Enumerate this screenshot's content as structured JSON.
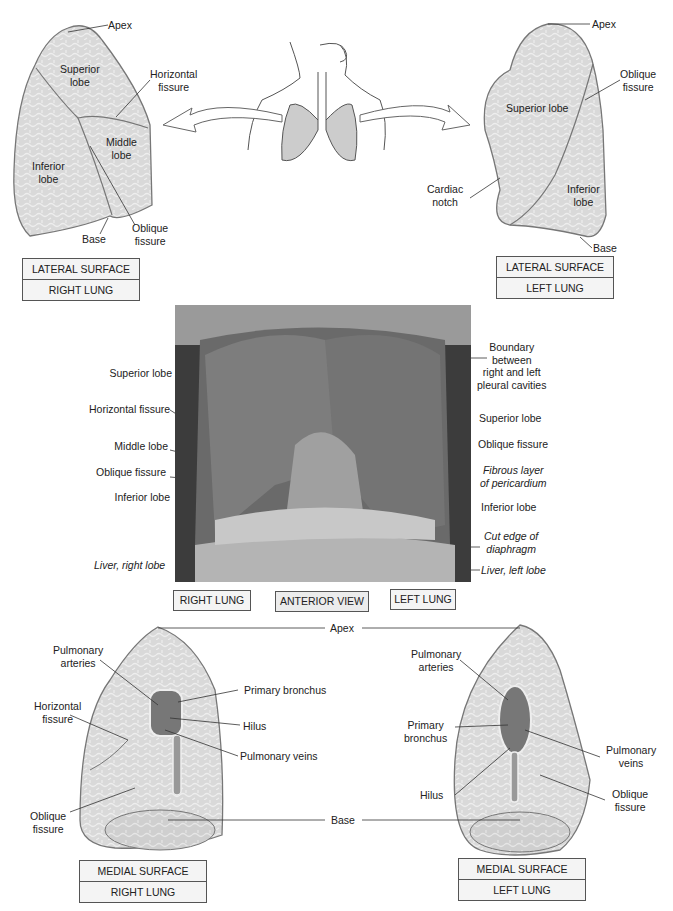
{
  "top_left": {
    "labels": {
      "apex": "Apex",
      "superior_lobe": "Superior\nlobe",
      "horizontal_fissure": "Horizontal\nfissure",
      "middle_lobe": "Middle\nlobe",
      "inferior_lobe": "Inferior\nlobe",
      "base": "Base",
      "oblique_fissure": "Oblique\nfissure"
    },
    "caption": {
      "line1": "LATERAL SURFACE",
      "line2": "RIGHT LUNG"
    }
  },
  "top_right": {
    "labels": {
      "apex": "Apex",
      "oblique_fissure": "Oblique\nfissure",
      "superior_lobe": "Superior lobe",
      "cardiac_notch": "Cardiac\nnotch",
      "inferior_lobe": "Inferior\nlobe",
      "base": "Base"
    },
    "caption": {
      "line1": "LATERAL SURFACE",
      "line2": "LEFT LUNG"
    }
  },
  "middle": {
    "left_labels": {
      "superior_lobe": "Superior lobe",
      "horizontal_fissure": "Horizontal fissure",
      "middle_lobe": "Middle lobe",
      "oblique_fissure": "Oblique fissure",
      "inferior_lobe": "Inferior lobe",
      "liver_right": "Liver, right lobe"
    },
    "right_labels": {
      "boundary": "Boundary\nbetween\nright and left\npleural cavities",
      "superior_lobe": "Superior lobe",
      "oblique_fissure": "Oblique fissure",
      "fibrous_layer": "Fibrous layer\nof pericardium",
      "inferior_lobe": "Inferior lobe",
      "cut_edge": "Cut edge of\ndiaphragm",
      "liver_left": "Liver, left lobe"
    },
    "tags": {
      "right": "RIGHT LUNG",
      "view": "ANTERIOR VIEW",
      "left": "LEFT LUNG"
    }
  },
  "bottom_left": {
    "labels": {
      "pulmonary_arteries": "Pulmonary\narteries",
      "horizontal_fissure": "Horizontal\nfissure",
      "primary_bronchus": "Primary bronchus",
      "hilus": "Hilus",
      "pulmonary_veins": "Pulmonary veins",
      "oblique_fissure": "Oblique\nfissure"
    },
    "caption": {
      "line1": "MEDIAL SURFACE",
      "line2": "RIGHT LUNG"
    }
  },
  "bottom_center": {
    "apex": "Apex",
    "base": "Base"
  },
  "bottom_right": {
    "labels": {
      "pulmonary_arteries": "Pulmonary\narteries",
      "primary_bronchus": "Primary\nbronchus",
      "hilus": "Hilus",
      "pulmonary_veins": "Pulmonary\nveins",
      "oblique_fissure": "Oblique\nfissure"
    },
    "caption": {
      "line1": "MEDIAL SURFACE",
      "line2": "LEFT LUNG"
    }
  }
}
